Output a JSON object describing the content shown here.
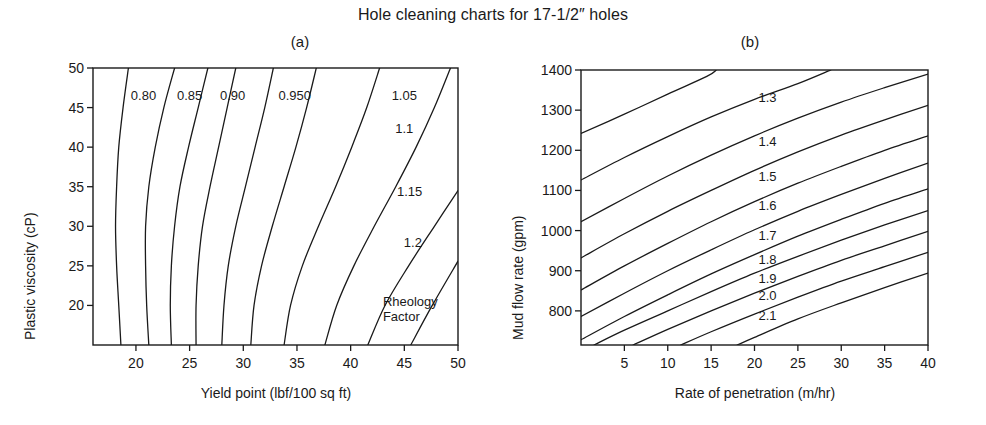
{
  "figure": {
    "title": "Hole cleaning charts for 17-1/2″ holes"
  },
  "panels": {
    "a": {
      "label": "(a)",
      "xlabel": "Yield point (lbf/100 sq ft)",
      "ylabel": "Plastic viscosity (cP)",
      "annotation_line1": "Rheology",
      "annotation_line2": "Factor",
      "xticks": [
        "20",
        "25",
        "30",
        "35",
        "40",
        "45",
        "50"
      ],
      "yticks": [
        "50",
        "45",
        "40",
        "35",
        "30",
        "25",
        "20"
      ],
      "contour_labels": [
        "0.80",
        "0.85",
        "0.90",
        "0.950",
        "1.05",
        "1.1",
        "1.15",
        "1.2"
      ]
    },
    "b": {
      "label": "(b)",
      "xlabel": "Rate of penetration (m/hr)",
      "ylabel": "Mud flow rate (gpm)",
      "xticks": [
        "5",
        "10",
        "15",
        "20",
        "25",
        "30",
        "35",
        "40"
      ],
      "yticks": [
        "1400",
        "1300",
        "1200",
        "1100",
        "1000",
        "900",
        "800"
      ],
      "contour_labels": [
        "1.3",
        "1.4",
        "1.5",
        "1.6",
        "1.7",
        "1.8",
        "1.9",
        "2.0",
        "2.1"
      ]
    }
  },
  "chart_data": [
    {
      "type": "line",
      "id": "panel-a",
      "title": "(a)",
      "figure_title": "Hole cleaning charts for 17-1/2″ holes",
      "xlabel": "Yield point (lbf/100 sq ft)",
      "ylabel": "Plastic viscosity (cP)",
      "xlim": [
        16.0,
        50.0
      ],
      "ylim": [
        15.0,
        50.0
      ],
      "xticks": [
        20,
        25,
        30,
        35,
        40,
        45,
        50
      ],
      "yticks": [
        20,
        25,
        30,
        35,
        40,
        45,
        50
      ],
      "grid": false,
      "legend": "none",
      "annotations": [
        "Rheology Factor"
      ],
      "quantity": "Rheology Factor",
      "note": "Contour lines of constant rheology factor; each series lists points as [yield_point, plastic_viscosity] traced from lower axis to upper axis.",
      "series": [
        {
          "name": "0.80",
          "label_x": 20.7,
          "label_y": 46.6,
          "points": [
            [
              18.6,
              15.0
            ],
            [
              18.4,
              20.0
            ],
            [
              18.2,
              25.0
            ],
            [
              18.1,
              30.0
            ],
            [
              18.2,
              35.0
            ],
            [
              18.4,
              40.0
            ],
            [
              18.8,
              45.0
            ],
            [
              19.3,
              50.0
            ]
          ]
        },
        {
          "name": "0.85",
          "label_x": 25.0,
          "label_y": 46.6,
          "points": [
            [
              21.2,
              15.0
            ],
            [
              21.0,
              20.0
            ],
            [
              20.9,
              25.0
            ],
            [
              20.9,
              30.0
            ],
            [
              21.2,
              35.0
            ],
            [
              21.8,
              40.0
            ],
            [
              22.6,
              45.0
            ],
            [
              23.6,
              50.0
            ]
          ]
        },
        {
          "name": "unlabeled-0.875",
          "label_x": null,
          "label_y": null,
          "points": [
            [
              23.3,
              15.0
            ],
            [
              23.2,
              20.0
            ],
            [
              23.3,
              25.0
            ],
            [
              23.6,
              30.0
            ],
            [
              24.1,
              35.0
            ],
            [
              24.9,
              40.0
            ],
            [
              25.8,
              45.0
            ],
            [
              26.7,
              50.0
            ]
          ]
        },
        {
          "name": "0.90",
          "label_x": 29.0,
          "label_y": 46.6,
          "points": [
            [
              25.6,
              15.0
            ],
            [
              25.6,
              20.0
            ],
            [
              25.8,
              25.0
            ],
            [
              26.2,
              30.0
            ],
            [
              26.9,
              35.0
            ],
            [
              27.7,
              40.0
            ],
            [
              28.5,
              45.0
            ],
            [
              29.3,
              50.0
            ]
          ]
        },
        {
          "name": "unlabeled-0.925",
          "label_x": null,
          "label_y": null,
          "points": [
            [
              28.0,
              15.0
            ],
            [
              28.2,
              20.0
            ],
            [
              28.6,
              25.0
            ],
            [
              29.3,
              30.0
            ],
            [
              30.2,
              35.0
            ],
            [
              31.1,
              40.0
            ],
            [
              32.0,
              45.0
            ],
            [
              32.8,
              50.0
            ]
          ]
        },
        {
          "name": "0.950",
          "label_x": 34.8,
          "label_y": 46.6,
          "points": [
            [
              30.7,
              15.0
            ],
            [
              31.0,
              20.0
            ],
            [
              31.7,
              25.0
            ],
            [
              32.7,
              30.0
            ],
            [
              33.8,
              35.0
            ],
            [
              34.9,
              40.0
            ],
            [
              35.9,
              45.0
            ],
            [
              36.8,
              50.0
            ]
          ]
        },
        {
          "name": "1.05",
          "label_x": 45.0,
          "label_y": 46.6,
          "points": [
            [
              33.8,
              15.0
            ],
            [
              34.4,
              20.0
            ],
            [
              35.5,
              25.0
            ],
            [
              37.0,
              30.0
            ],
            [
              38.6,
              35.0
            ],
            [
              40.1,
              40.0
            ],
            [
              41.5,
              45.0
            ],
            [
              42.7,
              50.0
            ]
          ]
        },
        {
          "name": "1.1",
          "label_x": 45.0,
          "label_y": 42.4,
          "points": [
            [
              37.6,
              15.0
            ],
            [
              38.7,
              20.0
            ],
            [
              40.3,
              25.0
            ],
            [
              42.2,
              30.0
            ],
            [
              44.2,
              35.0
            ],
            [
              46.1,
              40.0
            ],
            [
              47.8,
              45.0
            ],
            [
              49.3,
              50.0
            ]
          ]
        },
        {
          "name": "1.15",
          "label_x": 45.5,
          "label_y": 34.5,
          "points": [
            [
              41.6,
              15.0
            ],
            [
              43.2,
              20.0
            ],
            [
              45.4,
              25.0
            ],
            [
              47.8,
              30.0
            ],
            [
              50.0,
              34.5
            ]
          ]
        },
        {
          "name": "1.2",
          "label_x": 45.8,
          "label_y": 28.0,
          "points": [
            [
              45.6,
              15.0
            ],
            [
              47.6,
              20.0
            ],
            [
              50.0,
              25.6
            ]
          ]
        }
      ]
    },
    {
      "type": "line",
      "id": "panel-b",
      "title": "(b)",
      "xlabel": "Rate of penetration (m/hr)",
      "ylabel": "Mud flow rate (gpm)",
      "xlim": [
        0.0,
        40.0
      ],
      "ylim": [
        715.0,
        1400.0
      ],
      "xticks": [
        5,
        10,
        15,
        20,
        25,
        30,
        35,
        40
      ],
      "yticks": [
        800,
        900,
        1000,
        1100,
        1200,
        1300,
        1400
      ],
      "grid": false,
      "legend": "none",
      "quantity": "Rheology Factor",
      "note": "Contour lines of constant rheology factor; each series lists points as [rate_of_penetration, mud_flow_rate].",
      "series": [
        {
          "name": "1.3",
          "label_x": 21.5,
          "label_y": 1332,
          "points": [
            [
              0.0,
              1242
            ],
            [
              5.0,
              1290
            ],
            [
              10.0,
              1340
            ],
            [
              14.5,
              1384
            ],
            [
              15.6,
              1400
            ]
          ]
        },
        {
          "name": "1.4",
          "label_x": 21.5,
          "label_y": 1224,
          "points": [
            [
              0.0,
              1126
            ],
            [
              5.0,
              1182
            ],
            [
              10.0,
              1234
            ],
            [
              15.0,
              1283
            ],
            [
              20.0,
              1327
            ],
            [
              25.0,
              1366
            ],
            [
              28.8,
              1400
            ]
          ]
        },
        {
          "name": "1.5",
          "label_x": 21.5,
          "label_y": 1136,
          "points": [
            [
              0.0,
              1022
            ],
            [
              5.0,
              1080
            ],
            [
              10.0,
              1136
            ],
            [
              15.0,
              1188
            ],
            [
              20.0,
              1236
            ],
            [
              25.0,
              1280
            ],
            [
              30.0,
              1320
            ],
            [
              35.0,
              1356
            ],
            [
              40.0,
              1390
            ]
          ]
        },
        {
          "name": "1.6",
          "label_x": 21.5,
          "label_y": 1064,
          "points": [
            [
              0.0,
              932
            ],
            [
              5.0,
              992
            ],
            [
              10.0,
              1048
            ],
            [
              15.0,
              1100
            ],
            [
              20.0,
              1150
            ],
            [
              25.0,
              1196
            ],
            [
              30.0,
              1238
            ],
            [
              35.0,
              1276
            ],
            [
              40.0,
              1312
            ]
          ]
        },
        {
          "name": "1.7",
          "label_x": 21.5,
          "label_y": 990,
          "points": [
            [
              0.0,
              852
            ],
            [
              5.0,
              912
            ],
            [
              10.0,
              968
            ],
            [
              15.0,
              1022
            ],
            [
              20.0,
              1072
            ],
            [
              25.0,
              1118
            ],
            [
              30.0,
              1160
            ],
            [
              35.0,
              1200
            ],
            [
              40.0,
              1236
            ]
          ]
        },
        {
          "name": "1.8",
          "label_x": 21.5,
          "label_y": 930,
          "points": [
            [
              0.0,
              786
            ],
            [
              5.0,
              844
            ],
            [
              10.0,
              900
            ],
            [
              15.0,
              952
            ],
            [
              20.0,
              1002
            ],
            [
              25.0,
              1048
            ],
            [
              30.0,
              1090
            ],
            [
              35.0,
              1130
            ],
            [
              40.0,
              1168
            ]
          ]
        },
        {
          "name": "1.9",
          "label_x": 21.5,
          "label_y": 882,
          "points": [
            [
              0.0,
              728
            ],
            [
              5.0,
              786
            ],
            [
              10.0,
              840
            ],
            [
              15.0,
              892
            ],
            [
              20.0,
              940
            ],
            [
              25.0,
              986
            ],
            [
              30.0,
              1028
            ],
            [
              35.0,
              1068
            ],
            [
              40.0,
              1104
            ]
          ]
        },
        {
          "name": "2.0",
          "label_x": 21.5,
          "label_y": 840,
          "points": [
            [
              1.5,
              715
            ],
            [
              5.0,
              752
            ],
            [
              10.0,
              800
            ],
            [
              15.0,
              848
            ],
            [
              20.0,
              894
            ],
            [
              25.0,
              936
            ],
            [
              30.0,
              976
            ],
            [
              35.0,
              1014
            ],
            [
              40.0,
              1050
            ]
          ]
        },
        {
          "name": "2.1",
          "label_x": 21.5,
          "label_y": 790,
          "points": [
            [
              6.0,
              715
            ],
            [
              10.0,
              754
            ],
            [
              15.0,
              800
            ],
            [
              20.0,
              844
            ],
            [
              25.0,
              886
            ],
            [
              30.0,
              926
            ],
            [
              35.0,
              962
            ],
            [
              40.0,
              998
            ]
          ]
        },
        {
          "name": "unlabeled-2.2",
          "label_x": null,
          "label_y": null,
          "points": [
            [
              11.5,
              715
            ],
            [
              15.0,
              748
            ],
            [
              20.0,
              792
            ],
            [
              25.0,
              834
            ],
            [
              30.0,
              874
            ],
            [
              35.0,
              910
            ],
            [
              40.0,
              946
            ]
          ]
        },
        {
          "name": "unlabeled-2.3",
          "label_x": null,
          "label_y": null,
          "points": [
            [
              18.0,
              715
            ],
            [
              20.0,
              734
            ],
            [
              25.0,
              780
            ],
            [
              30.0,
              820
            ],
            [
              35.0,
              858
            ],
            [
              40.0,
              894
            ]
          ]
        }
      ]
    }
  ]
}
